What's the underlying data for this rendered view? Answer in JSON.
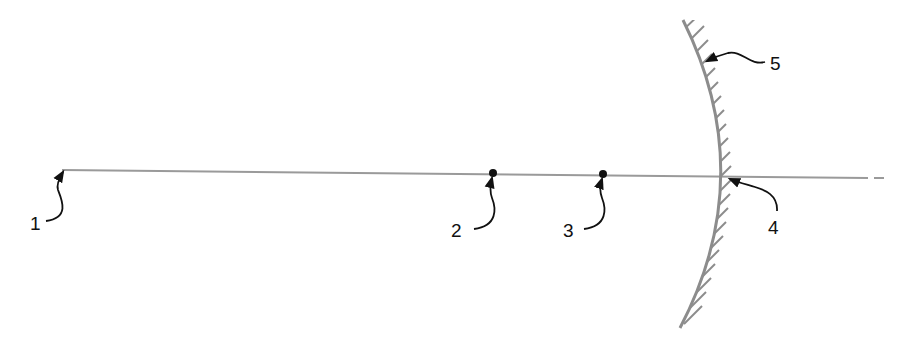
{
  "diagram": {
    "type": "concave-mirror-optical-axis",
    "colors": {
      "axis": "#9a9a9a",
      "mirror": "#8c8c8c",
      "hatch": "#8c8c8c",
      "ink": "#111111",
      "background": "#ffffff"
    },
    "labels": [
      {
        "id": "1",
        "text": "1",
        "target": "axis-start"
      },
      {
        "id": "2",
        "text": "2",
        "target": "point-2"
      },
      {
        "id": "3",
        "text": "3",
        "target": "point-3"
      },
      {
        "id": "4",
        "text": "4",
        "target": "mirror-vertex"
      },
      {
        "id": "5",
        "text": "5",
        "target": "mirror-surface"
      }
    ]
  }
}
